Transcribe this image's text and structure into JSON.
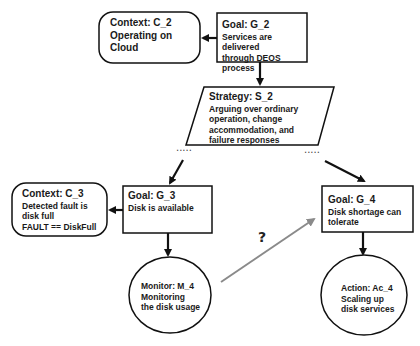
{
  "diagram": {
    "type": "Goal Structuring Notation (GSN) argument",
    "nodes": {
      "context_c2": {
        "title": "Context: C_2",
        "body": "Operating on Cloud"
      },
      "goal_g2": {
        "title": "Goal: G_2",
        "body_line1": "Services are delivered",
        "body_line2": "through DEOS process"
      },
      "strategy_s2": {
        "title": "Strategy: S_2",
        "body_line1": "Arguing over ordinary",
        "body_line2": "operation, change",
        "body_line3": "accommodation, and",
        "body_line4": "failure responses"
      },
      "context_c3": {
        "title": "Context: C_3",
        "body_line1": "Detected fault is",
        "body_line2": "disk full",
        "body_line3": "FAULT == DiskFull"
      },
      "goal_g3": {
        "title": "Goal: G_3",
        "body": "Disk is available"
      },
      "goal_g4": {
        "title": "Goal: G_4",
        "body_line1": "Disk shortage can",
        "body_line2": "tolerate"
      },
      "monitor_m4": {
        "title": "Monitor: M_4",
        "body_line1": "Monitoring",
        "body_line2": "the disk usage"
      },
      "action_ac4": {
        "title": "Action: Ac_4",
        "body_line1": "Scaling up",
        "body_line2": "disk services"
      }
    },
    "edges": [
      {
        "from": "Goal: G_2",
        "to": "Context: C_2",
        "style": "solid-black"
      },
      {
        "from": "Goal: G_2",
        "to": "Strategy: S_2",
        "style": "solid-black"
      },
      {
        "from": "Strategy: S_2",
        "to": "Goal: G_3",
        "style": "solid-black"
      },
      {
        "from": "Strategy: S_2",
        "to": "Goal: G_4",
        "style": "solid-black"
      },
      {
        "from": "Goal: G_3",
        "to": "Context: C_3",
        "style": "solid-black"
      },
      {
        "from": "Goal: G_3",
        "to": "Monitor: M_4",
        "style": "solid-black"
      },
      {
        "from": "Goal: G_4",
        "to": "Action: Ac_4",
        "style": "solid-black"
      },
      {
        "from": "Monitor: M_4",
        "to": "Goal: G_4",
        "style": "solid-gray",
        "label": "?"
      }
    ],
    "ellipsis_left": ".....",
    "ellipsis_right": ".....",
    "question_label": "?",
    "colors": {
      "stroke": "#111111",
      "question_arrow": "#8a8a8a",
      "background": "#ffffff"
    }
  }
}
